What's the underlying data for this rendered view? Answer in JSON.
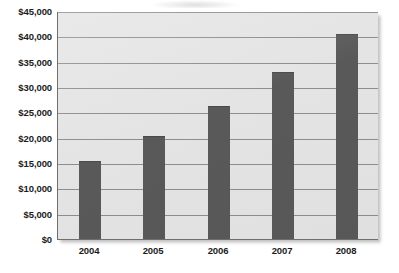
{
  "chart_data": {
    "type": "bar",
    "title": "",
    "subtitle": "",
    "xlabel": "",
    "ylabel": "",
    "categories": [
      "2004",
      "2005",
      "2006",
      "2007",
      "2008"
    ],
    "values": [
      15400,
      20300,
      26200,
      33000,
      40400
    ],
    "series": [
      {
        "name": "",
        "values": [
          15400,
          20300,
          26200,
          33000,
          40400
        ]
      }
    ],
    "ylim": [
      0,
      45000
    ],
    "ytick_values": [
      0,
      5000,
      10000,
      15000,
      20000,
      25000,
      30000,
      35000,
      40000,
      45000
    ],
    "ytick_labels": [
      "$0",
      "$5,000",
      "$10,000",
      "$15,000",
      "$20,000",
      "$25,000",
      "$30,000",
      "$35,000",
      "$40,000",
      "$45,000"
    ],
    "xtick_labels": [
      "2004",
      "2005",
      "2006",
      "2007",
      "2008"
    ],
    "grid": true,
    "grid_axis": "y",
    "legend": false,
    "legend_position": "none",
    "annotations": [],
    "colors": {
      "bar": "#595959",
      "plot_background": "#e4e4e4",
      "gridline": "#8d8d8d",
      "axis_line": "#6f6f6f",
      "tick_label": "#1b1b1b",
      "page_background": "#ffffff"
    }
  }
}
